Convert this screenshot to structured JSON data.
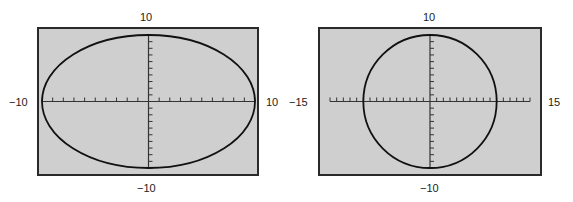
{
  "colors": {
    "screen_bg": "#cfcfcf",
    "border": "#2a2a2a",
    "curve": "#111111",
    "axis": "#333333"
  },
  "chart_data": [
    {
      "type": "line",
      "title": "",
      "description": "Ellipse on calculator viewing window (non-square window)",
      "window": {
        "xmin": -10,
        "xmax": 10,
        "ymin": -10,
        "ymax": 10,
        "xscl": 1,
        "yscl": 1
      },
      "labels": {
        "top": "10",
        "bottom": "-10",
        "left": "-10",
        "right": "10"
      },
      "curve": "circle radius 10 displayed in a non-square window (appears as ellipse)",
      "grid": false
    },
    {
      "type": "line",
      "title": "",
      "description": "Circle on square viewing window",
      "window": {
        "xmin": -15,
        "xmax": 15,
        "ymin": -10,
        "ymax": 10,
        "xscl": 1,
        "yscl": 1
      },
      "labels": {
        "top": "10",
        "bottom": "-10",
        "left": "-15",
        "right": "15"
      },
      "curve": "circle radius 10 displayed in a square window",
      "grid": false
    }
  ],
  "left": {
    "top": "10",
    "bottom": "−10",
    "left": "−10",
    "right": "10"
  },
  "right": {
    "top": "10",
    "bottom": "−10",
    "left": "−15",
    "right": "15"
  }
}
